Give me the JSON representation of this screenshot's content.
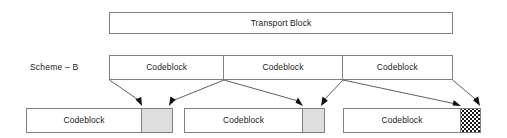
{
  "diagram": {
    "title_label": "Transport Block",
    "scheme_label": "Scheme – B",
    "stroke_color": "#808080",
    "arrow_color": "#4d4d4d",
    "filler_gray": "#dedede",
    "background": "#ffffff"
  },
  "transport_block": {
    "label": "Transport Block"
  },
  "middle_row": {
    "cells": [
      {
        "label": "Codeblock"
      },
      {
        "label": "Codeblock"
      },
      {
        "label": "Codeblock"
      }
    ]
  },
  "bottom_row": {
    "blocks": [
      {
        "label": "Codeblock",
        "tail": "gray-filler"
      },
      {
        "label": "Codeblock",
        "tail": "gray-filler"
      },
      {
        "label": "Codeblock",
        "tail": "dotted-filler"
      }
    ]
  },
  "connectors": [
    {
      "from": "middle-row-left-edge",
      "to": "bottom-block-1-filler-left"
    },
    {
      "from": "middle-divider-1",
      "to": "bottom-block-1-filler-right"
    },
    {
      "from": "middle-divider-1",
      "to": "bottom-block-2-filler-left"
    },
    {
      "from": "middle-divider-2",
      "to": "bottom-block-2-filler-right"
    },
    {
      "from": "middle-divider-2",
      "to": "bottom-block-3-filler-left"
    },
    {
      "from": "middle-row-right-edge",
      "to": "bottom-block-3-filler-right"
    }
  ]
}
